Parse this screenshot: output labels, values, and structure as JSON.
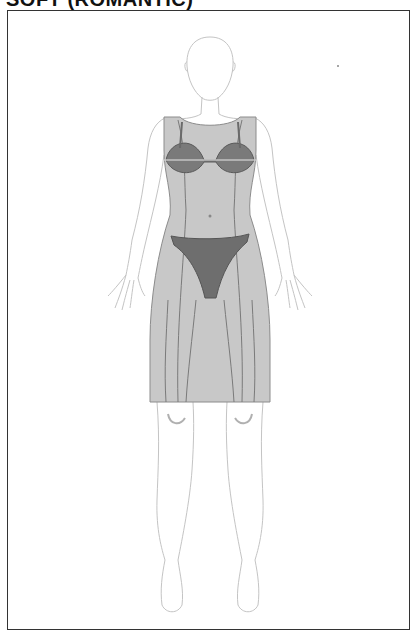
{
  "title": "SOFT (ROMANTIC)",
  "figure": {
    "garments": [
      {
        "name": "sheath-dress",
        "color": "#c8c8c8"
      },
      {
        "name": "bra",
        "color": "#7a7a7a"
      },
      {
        "name": "briefs",
        "color": "#6e6e6e"
      }
    ],
    "outline_color": "#bdbdbd",
    "seam_color": "#777777"
  }
}
